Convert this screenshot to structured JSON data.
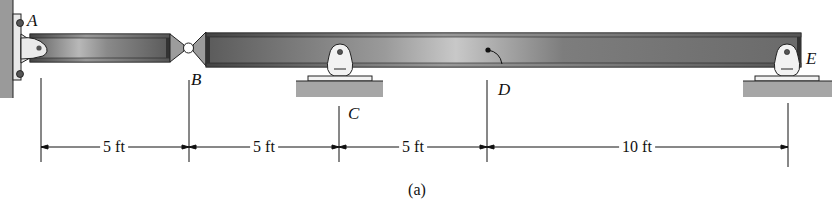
{
  "figure": {
    "caption": "(a)",
    "points": {
      "A": "A",
      "B": "B",
      "C": "C",
      "D": "D",
      "E": "E"
    },
    "dimensions": [
      {
        "from": "A",
        "to": "B",
        "label": "5 ft"
      },
      {
        "from": "B",
        "to": "C",
        "label": "5 ft"
      },
      {
        "from": "C",
        "to": "D",
        "label": "5 ft"
      },
      {
        "from": "D",
        "to": "E",
        "label": "10 ft"
      }
    ],
    "supports": {
      "A": "fixed wall with pin bracket",
      "B": "internal hinge",
      "C": "rocker/roller support",
      "E": "rocker/roller support"
    },
    "colors": {
      "beam_dark": "#555555",
      "beam_light": "#bdbdbd",
      "ground": "#a6a6a6",
      "line": "#111111"
    }
  }
}
